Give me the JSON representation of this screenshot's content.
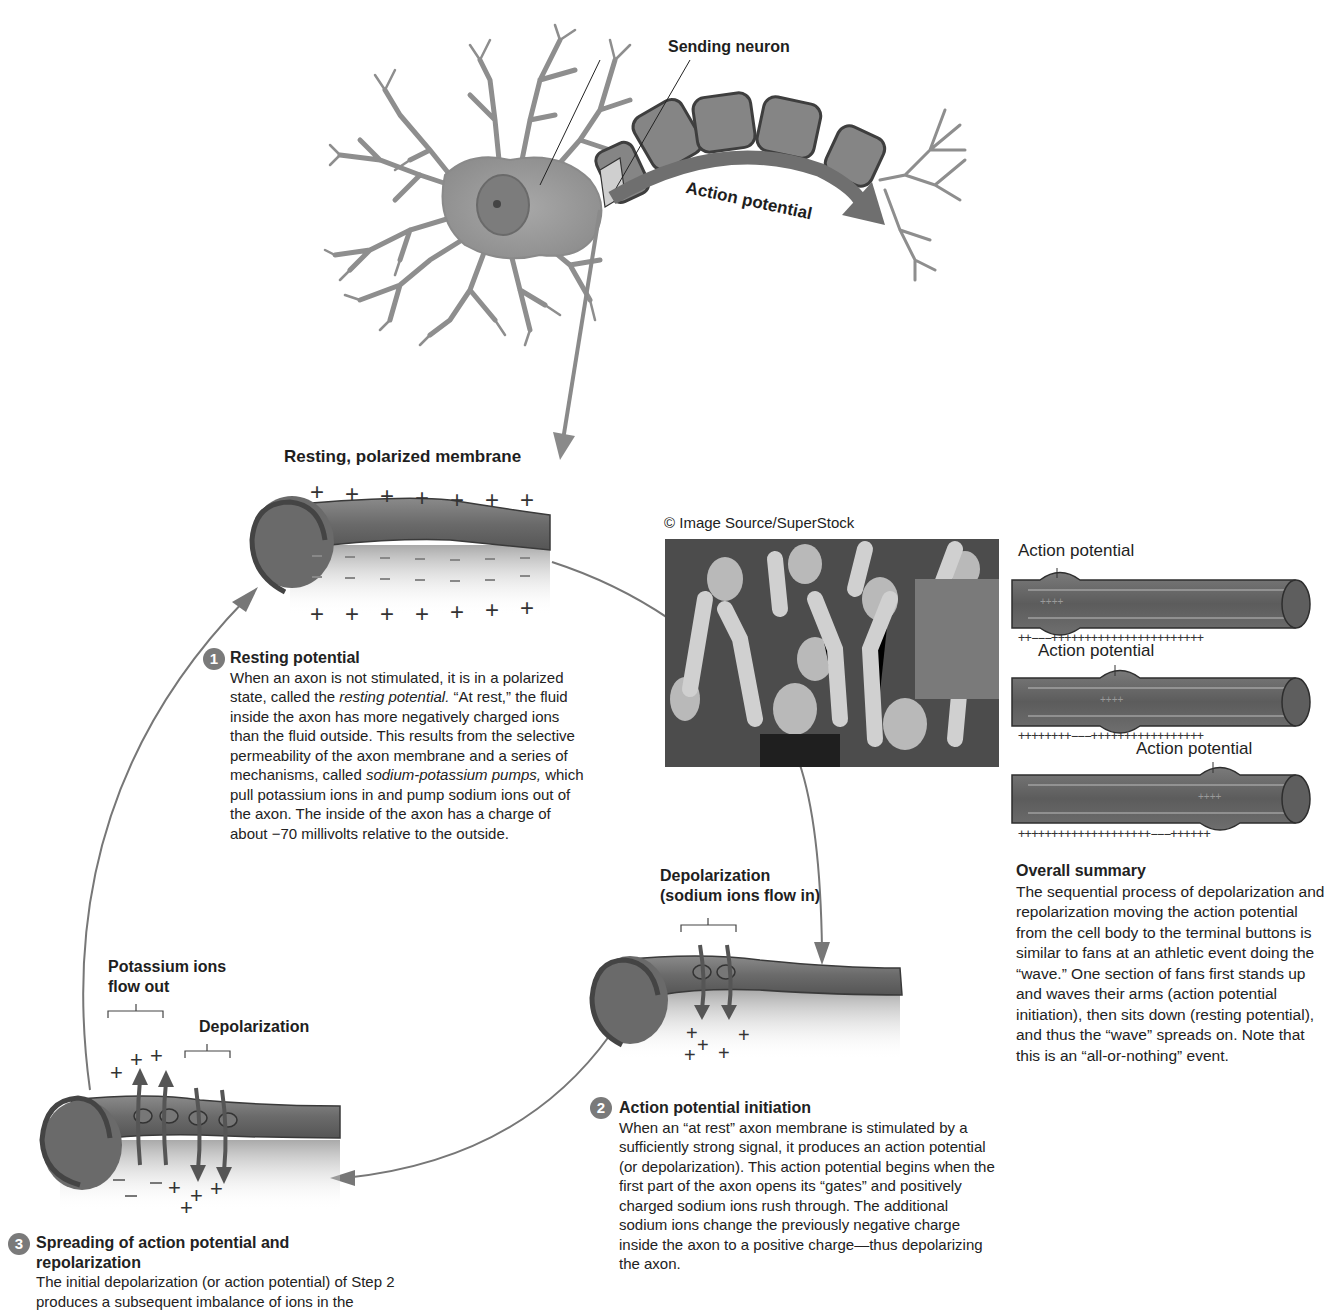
{
  "figure": {
    "top_diagram": {
      "label_sending_neuron": "Sending neuron",
      "label_action_potential_arrow": "Action potential"
    },
    "resting_membrane": {
      "label": "Resting, polarized membrane",
      "outside_charge": "+",
      "inside_charge": "−"
    },
    "step1": {
      "number": "1",
      "title": "Resting potential",
      "text_parts": [
        "When an axon is not stimulated, it is in a polarized state, called the ",
        "resting potential.",
        " “At rest,” the fluid inside the axon has more negatively charged ions than the fluid outside. This results from the selective permeability of the axon membrane and a series of mechanisms, called ",
        "sodium-potassium pumps,",
        " which pull potassium ions in and pump sodium ions out of the axon. The inside of the axon has a charge of about −70 millivolts relative to the outside."
      ]
    },
    "photo": {
      "credit": "© Image Source/SuperStock",
      "description": "Crowd of sports fans raising arms doing the wave"
    },
    "summary_axons": {
      "labels": [
        "Action potential",
        "Action potential",
        "Action potential"
      ],
      "charge_rows": [
        "++−−−+++++++++++++++++++++++",
        "++++++++−−−+++++++++++++++++",
        "++++++++++++++++++++−−−++++++"
      ],
      "inside_charges": [
        "++++",
        "++++",
        "++++"
      ]
    },
    "overall_summary": {
      "title": "Overall summary",
      "text": "The sequential process of depolarization and repolarization moving the action potential from the cell body to the terminal buttons is similar to fans at an athletic event doing the “wave.” One section of fans first stands up and waves their arms (action potential initiation), then sits down (resting potential), and thus the “wave” spreads on. Note that this is an “all-or-nothing” event."
    },
    "depolarization_diagram": {
      "label_line1": "Depolarization",
      "label_line2": "(sodium ions flow in)"
    },
    "step2": {
      "number": "2",
      "title": "Action potential initiation",
      "text": "When an “at rest” axon membrane is stimulated by a sufficiently strong signal, it produces an action potential (or depolarization). This action potential begins when the first part of the axon opens its “gates” and positively charged sodium ions rush through. The additional sodium ions change the previously negative charge inside the axon to a positive charge—thus depolarizing the axon."
    },
    "repolarization_diagram": {
      "label_potassium_line1": "Potassium ions",
      "label_potassium_line2": "flow out",
      "label_depolarization": "Depolarization"
    },
    "step3": {
      "number": "3",
      "title_line1": "Spreading of action potential and",
      "title_line2": "repolarization",
      "text": "The initial depolarization (or action potential) of Step 2 produces a subsequent imbalance of ions in the"
    },
    "colors": {
      "axon_fill": "#6b6b6b",
      "axon_dark": "#4a4a4a",
      "neuron_fill": "#9a9a9a",
      "arrow_gray": "#7d7d7d",
      "text": "#1e1e1e",
      "badge": "#7a7a7a"
    }
  }
}
